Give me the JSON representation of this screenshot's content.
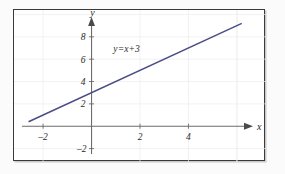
{
  "figure": {
    "background_color": "#ffffff",
    "border_color": "#3a3a3a",
    "page_color": "#fbfbfb"
  },
  "chart_data": {
    "type": "line",
    "title": "",
    "subtitle": "",
    "xlabel": "x",
    "ylabel": "y",
    "equation": "y=x+3",
    "annotations": [
      {
        "text": "y=x+3",
        "x": 0.9,
        "y": 6.6
      }
    ],
    "series": [
      {
        "name": "y=x+3",
        "color": "#4a4d86",
        "slope": 1,
        "intercept": 3,
        "x": [
          -2.6,
          6.2
        ],
        "values": [
          0.4,
          9.2
        ],
        "points": [
          {
            "x": -2.6,
            "y": 0.4
          },
          {
            "x": -2,
            "y": 1
          },
          {
            "x": 0,
            "y": 3
          },
          {
            "x": 2,
            "y": 5
          },
          {
            "x": 4,
            "y": 7
          },
          {
            "x": 6.2,
            "y": 9.2
          }
        ]
      }
    ],
    "xlim": [
      -3.2,
      7.2
    ],
    "ylim": [
      -3.2,
      10.4
    ],
    "xticks": [
      -2,
      2,
      4
    ],
    "xtick_labels": [
      "-2",
      "2",
      "4"
    ],
    "yticks": [
      -2,
      2,
      4,
      6,
      8
    ],
    "ytick_labels": [
      "-2",
      "2",
      "4",
      "6",
      "8"
    ],
    "grid": true,
    "grid_color": "#ececec",
    "legend": false,
    "legend_position": "none",
    "axis_color": "#6b6b6b",
    "x_axis_arrow": true,
    "y_axis_arrow": true
  }
}
